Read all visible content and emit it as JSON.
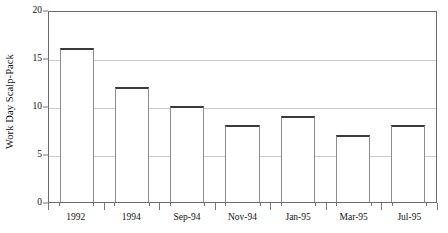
{
  "chart_data": {
    "type": "bar",
    "title": "",
    "subtitle": "",
    "xlabel": "",
    "ylabel": "Work Day Scalp-Pack",
    "categories": [
      "1992",
      "1994",
      "Sep-94",
      "Nov-94",
      "Jan-95",
      "Mar-95",
      "Jul-95"
    ],
    "values": [
      16,
      12,
      10,
      8,
      9,
      7,
      8
    ],
    "ylim": [
      0,
      20
    ],
    "yticks": [
      0,
      5,
      10,
      15,
      20
    ],
    "ytick_labels": [
      "0",
      "5",
      "10",
      "15",
      "20"
    ],
    "grid": true,
    "grid_axis": "y",
    "legend": false,
    "legend_position": "none",
    "series": [
      {
        "name": "Work Day Scalp-Pack",
        "values": [
          16,
          12,
          10,
          8,
          9,
          7,
          8
        ]
      }
    ],
    "colors": {
      "bar_fill": "#ffffff",
      "bar_top_edge": "#3a3a3a",
      "bar_side_edge": "#8d8d8d",
      "gridline": "#c9c9c9",
      "axis": "#6b6b6b",
      "text": "#111111",
      "background": "#ffffff"
    }
  }
}
